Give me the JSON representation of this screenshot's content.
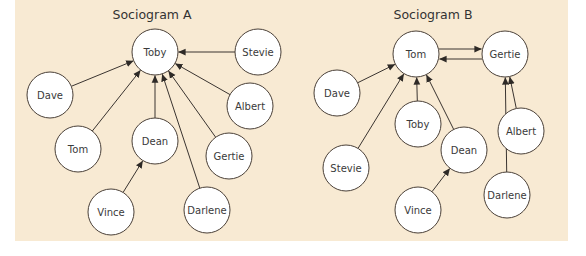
{
  "colors": {
    "background": "#f8ead3",
    "node_fill": "#ffffff",
    "node_stroke": "#4a4038",
    "edge": "#3a3430",
    "text": "#333333"
  },
  "diagrams": [
    {
      "id": "A",
      "title": "Sociogram A",
      "title_pos": [
        152,
        19
      ],
      "nodes": [
        {
          "name": "Toby",
          "x": 155,
          "y": 52
        },
        {
          "name": "Stevie",
          "x": 258,
          "y": 52
        },
        {
          "name": "Dave",
          "x": 50,
          "y": 95
        },
        {
          "name": "Albert",
          "x": 250,
          "y": 106
        },
        {
          "name": "Tom",
          "x": 78,
          "y": 149
        },
        {
          "name": "Dean",
          "x": 155,
          "y": 141
        },
        {
          "name": "Gertie",
          "x": 229,
          "y": 156
        },
        {
          "name": "Vince",
          "x": 111,
          "y": 212
        },
        {
          "name": "Darlene",
          "x": 207,
          "y": 210
        }
      ],
      "edges": [
        {
          "from": "Stevie",
          "to": "Toby"
        },
        {
          "from": "Dave",
          "to": "Toby"
        },
        {
          "from": "Albert",
          "to": "Toby"
        },
        {
          "from": "Tom",
          "to": "Toby"
        },
        {
          "from": "Dean",
          "to": "Toby"
        },
        {
          "from": "Gertie",
          "to": "Toby"
        },
        {
          "from": "Darlene",
          "to": "Toby"
        },
        {
          "from": "Vince",
          "to": "Dean"
        }
      ]
    },
    {
      "id": "B",
      "title": "Sociogram B",
      "title_pos": [
        433,
        19
      ],
      "nodes": [
        {
          "name": "Tom",
          "x": 416,
          "y": 54
        },
        {
          "name": "Gertie",
          "x": 505,
          "y": 54
        },
        {
          "name": "Dave",
          "x": 337,
          "y": 93
        },
        {
          "name": "Toby",
          "x": 418,
          "y": 124
        },
        {
          "name": "Albert",
          "x": 521,
          "y": 131
        },
        {
          "name": "Stevie",
          "x": 346,
          "y": 168
        },
        {
          "name": "Dean",
          "x": 464,
          "y": 150
        },
        {
          "name": "Vince",
          "x": 418,
          "y": 210
        },
        {
          "name": "Darlene",
          "x": 507,
          "y": 195
        }
      ],
      "edges": [
        {
          "from": "Tom",
          "to": "Gertie",
          "offset": -5
        },
        {
          "from": "Gertie",
          "to": "Tom",
          "offset": -5
        },
        {
          "from": "Dave",
          "to": "Tom"
        },
        {
          "from": "Stevie",
          "to": "Tom"
        },
        {
          "from": "Toby",
          "to": "Tom"
        },
        {
          "from": "Dean",
          "to": "Tom"
        },
        {
          "from": "Darlene",
          "to": "Gertie"
        },
        {
          "from": "Albert",
          "to": "Gertie"
        },
        {
          "from": "Vince",
          "to": "Dean"
        }
      ]
    }
  ],
  "node_radius": 23
}
